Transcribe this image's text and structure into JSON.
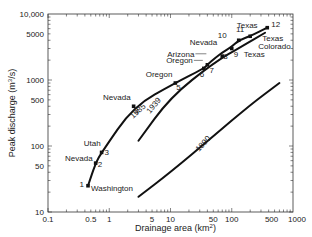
{
  "chart_data": {
    "type": "line",
    "title": "",
    "xlabel": "Drainage area (km²)",
    "ylabel": "Peak discharge (m³/s)",
    "xscale": "log",
    "yscale": "log",
    "xlim": [
      0.1,
      1000
    ],
    "ylim": [
      10,
      10000
    ],
    "grid": false,
    "x_ticks": [
      "0.1",
      "0.5",
      "1",
      "5",
      "10",
      "50",
      "100",
      "500",
      "1000"
    ],
    "y_ticks": [
      "10",
      "50",
      "100",
      "500",
      "1000",
      "5000",
      "10,000"
    ],
    "series": [
      {
        "name": "1985",
        "x": [
          0.45,
          0.6,
          0.75,
          2.5,
          12,
          35,
          40,
          55,
          70,
          100,
          130,
          200,
          380
        ],
        "y": [
          25,
          55,
          80,
          400,
          900,
          1500,
          1700,
          2200,
          2600,
          3200,
          4000,
          4600,
          6200
        ]
      },
      {
        "name": "1939",
        "x": [
          3,
          10,
          50,
          150,
          350
        ],
        "y": [
          120,
          550,
          1800,
          3300,
          5200
        ]
      },
      {
        "name": "1890",
        "x": [
          3,
          10,
          50,
          200,
          600
        ],
        "y": [
          17,
          40,
          140,
          420,
          900
        ]
      }
    ],
    "points": [
      {
        "id": "1",
        "state": "Washington",
        "x": 0.45,
        "y": 25
      },
      {
        "id": "2",
        "state": "Nevada",
        "x": 0.6,
        "y": 55
      },
      {
        "id": "3",
        "state": "Utah",
        "x": 0.75,
        "y": 80
      },
      {
        "id": "4",
        "state": "Nevada",
        "x": 2.5,
        "y": 400
      },
      {
        "id": "5",
        "state": "Oregon",
        "x": 12,
        "y": 900
      },
      {
        "id": "6",
        "state": "Oregon",
        "x": 35,
        "y": 1500
      },
      {
        "id": "7",
        "state": "Arizona",
        "x": 40,
        "y": 1700
      },
      {
        "id": "8",
        "state": "Nevada",
        "x": 70,
        "y": 2300
      },
      {
        "id": "9",
        "state": "Texas",
        "x": 100,
        "y": 3000
      },
      {
        "id": "10",
        "state": "Texas",
        "x": 130,
        "y": 4000
      },
      {
        "id": "11",
        "state": "Colorado",
        "x": 200,
        "y": 4600
      },
      {
        "id": "12",
        "state": "Texas",
        "x": 380,
        "y": 6200
      }
    ]
  },
  "labels": {
    "xlabel": "Drainage area (km",
    "xlabel_sup": "2",
    "xlabel_end": ")",
    "ylabel": "Peak discharge (m",
    "ylabel_sup": "3",
    "ylabel_end": "/s)",
    "curve_1985": "1985",
    "curve_1939": "1939",
    "curve_1890": "1890"
  }
}
